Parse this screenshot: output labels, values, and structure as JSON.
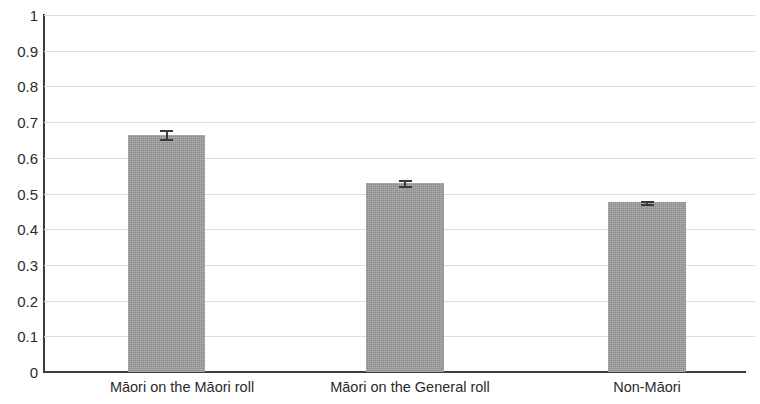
{
  "chart_data": {
    "type": "bar",
    "title": "",
    "subtitle": "",
    "xlabel": "",
    "ylabel": "",
    "categories": [
      "Māori on the Māori roll",
      "Māori on the General roll",
      "Non-Māori"
    ],
    "values": [
      0.665,
      0.53,
      0.475
    ],
    "errors": [
      0.013,
      0.008,
      0.004
    ],
    "ylim": [
      0,
      1
    ],
    "ytick_labels": [
      "0",
      "0.1",
      "0.2",
      "0.3",
      "0.4",
      "0.5",
      "0.6",
      "0.7",
      "0.8",
      "0.9",
      "1"
    ],
    "ytick_values": [
      0,
      0.1,
      0.2,
      0.3,
      0.4,
      0.5,
      0.6,
      0.7,
      0.8,
      0.9,
      1
    ],
    "grid": true,
    "grid_axis": "y",
    "legend": false,
    "legend_position": "none",
    "bar_color": "#9b9b9b",
    "grid_color": "#dcdcdc",
    "axis_color": "#3d3d3d",
    "error_bar_color": "#3a3a3a",
    "annotations": []
  }
}
